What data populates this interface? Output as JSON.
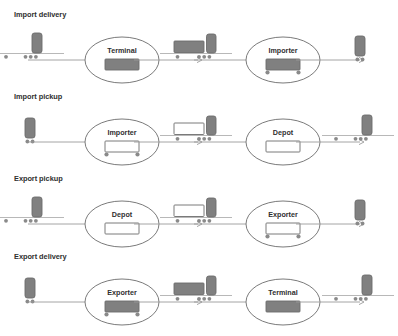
{
  "diagram": {
    "colors": {
      "fill_loaded": "#808080",
      "fill_empty": "#ffffff",
      "stroke": "#6b6b6b",
      "text": "#2f2f2f",
      "arrow": "#9a9a9a",
      "ground": "#b0b0b0"
    },
    "rows": [
      {
        "label": "Import delivery",
        "sequence": [
          {
            "kind": "tractor-on-ground",
            "name": "bobtail-tractor",
            "loaded": false,
            "wheels_left": 1,
            "wheels_right": 3
          },
          {
            "kind": "arrow",
            "name": "flow-arrow"
          },
          {
            "kind": "node",
            "name": "terminal",
            "label": "Terminal",
            "loaded": true,
            "wheels": 0
          },
          {
            "kind": "arrow",
            "name": "flow-arrow"
          },
          {
            "kind": "truck-on-ground",
            "name": "truck-with-container",
            "loaded": true,
            "wheels_left": 1,
            "wheels_right": 3
          },
          {
            "kind": "arrow",
            "name": "flow-arrow"
          },
          {
            "kind": "node",
            "name": "importer",
            "label": "Importer",
            "loaded": true,
            "wheels": 2
          },
          {
            "kind": "arrow",
            "name": "flow-arrow"
          },
          {
            "kind": "tractor",
            "name": "bobtail-tractor",
            "loaded": true,
            "wheels": 2
          }
        ]
      },
      {
        "label": "Import pickup",
        "sequence": [
          {
            "kind": "tractor",
            "name": "bobtail-tractor",
            "loaded": true,
            "wheels": 2
          },
          {
            "kind": "arrow",
            "name": "flow-arrow"
          },
          {
            "kind": "node",
            "name": "importer",
            "label": "Importer",
            "loaded": false,
            "wheels": 2
          },
          {
            "kind": "arrow",
            "name": "flow-arrow"
          },
          {
            "kind": "truck-on-ground",
            "name": "truck-with-container",
            "loaded": false,
            "wheels_left": 1,
            "wheels_right": 3
          },
          {
            "kind": "arrow",
            "name": "flow-arrow"
          },
          {
            "kind": "node",
            "name": "depot",
            "label": "Depot",
            "loaded": false,
            "wheels": 0
          },
          {
            "kind": "arrow",
            "name": "flow-arrow"
          },
          {
            "kind": "tractor-on-ground",
            "name": "bobtail-tractor",
            "loaded": true,
            "wheels_left": 1,
            "wheels_right": 3
          }
        ]
      },
      {
        "label": "Export pickup",
        "sequence": [
          {
            "kind": "tractor-on-ground",
            "name": "bobtail-tractor",
            "loaded": true,
            "wheels_left": 1,
            "wheels_right": 3
          },
          {
            "kind": "arrow",
            "name": "flow-arrow"
          },
          {
            "kind": "node",
            "name": "depot",
            "label": "Depot",
            "loaded": false,
            "wheels": 0
          },
          {
            "kind": "arrow",
            "name": "flow-arrow"
          },
          {
            "kind": "truck-on-ground",
            "name": "truck-with-container",
            "loaded": false,
            "wheels_left": 1,
            "wheels_right": 3
          },
          {
            "kind": "arrow",
            "name": "flow-arrow"
          },
          {
            "kind": "node",
            "name": "exporter",
            "label": "Exporter",
            "loaded": false,
            "wheels": 2
          },
          {
            "kind": "arrow",
            "name": "flow-arrow"
          },
          {
            "kind": "tractor",
            "name": "bobtail-tractor",
            "loaded": true,
            "wheels": 2
          }
        ]
      },
      {
        "label": "Export delivery",
        "sequence": [
          {
            "kind": "tractor",
            "name": "bobtail-tractor",
            "loaded": true,
            "wheels": 2
          },
          {
            "kind": "arrow",
            "name": "flow-arrow"
          },
          {
            "kind": "node",
            "name": "exporter",
            "label": "Exporter",
            "loaded": true,
            "wheels": 2
          },
          {
            "kind": "arrow",
            "name": "flow-arrow"
          },
          {
            "kind": "truck-on-ground",
            "name": "truck-with-container",
            "loaded": true,
            "wheels_left": 1,
            "wheels_right": 3
          },
          {
            "kind": "arrow",
            "name": "flow-arrow"
          },
          {
            "kind": "node",
            "name": "terminal",
            "label": "Terminal",
            "loaded": true,
            "wheels": 0
          },
          {
            "kind": "arrow",
            "name": "flow-arrow"
          },
          {
            "kind": "tractor-on-ground",
            "name": "bobtail-tractor",
            "loaded": true,
            "wheels_left": 1,
            "wheels_right": 3
          }
        ]
      }
    ]
  }
}
